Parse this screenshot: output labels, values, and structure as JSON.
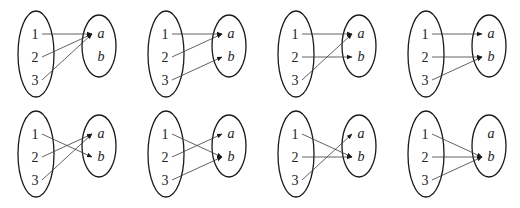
{
  "figure": {
    "domain_labels": [
      "1",
      "2",
      "3"
    ],
    "codomain_labels": [
      "a",
      "b"
    ],
    "colors": {
      "stroke": "#1a1a1a",
      "arrow": "#3a3a3a",
      "text": "#222222",
      "background": "#ffffff"
    },
    "panels": [
      {
        "row": 0,
        "col": 0,
        "mapping": {
          "1": "a",
          "2": "a",
          "3": "a"
        }
      },
      {
        "row": 0,
        "col": 1,
        "mapping": {
          "1": "a",
          "2": "a",
          "3": "b"
        }
      },
      {
        "row": 0,
        "col": 2,
        "mapping": {
          "1": "a",
          "2": "b",
          "3": "a"
        }
      },
      {
        "row": 0,
        "col": 3,
        "mapping": {
          "1": "a",
          "2": "b",
          "3": "b"
        }
      },
      {
        "row": 1,
        "col": 0,
        "mapping": {
          "1": "b",
          "2": "a",
          "3": "a"
        }
      },
      {
        "row": 1,
        "col": 1,
        "mapping": {
          "1": "b",
          "2": "a",
          "3": "b"
        }
      },
      {
        "row": 1,
        "col": 2,
        "mapping": {
          "1": "b",
          "2": "b",
          "3": "a"
        }
      },
      {
        "row": 1,
        "col": 3,
        "mapping": {
          "1": "b",
          "2": "b",
          "3": "b"
        }
      }
    ]
  }
}
